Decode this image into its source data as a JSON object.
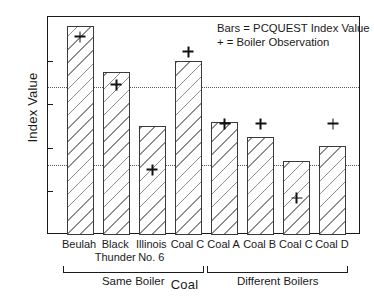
{
  "chart_data": {
    "type": "bar",
    "title": "",
    "xlabel": "Coal",
    "ylabel": "Index Value",
    "ylim": [
      0,
      100
    ],
    "yticks": [
      0,
      20,
      40,
      60,
      80,
      100
    ],
    "ytick_labels": [
      "0",
      "20",
      "40",
      "60",
      "80",
      "100"
    ],
    "grid": false,
    "legend_position": "top-right",
    "legend": [
      "Bars = PCQUEST Index Value",
      "+ = Boiler Observation"
    ],
    "categories": [
      "Beulah",
      "Black Thunder",
      "Illinois No. 6",
      "Coal C",
      "Coal A",
      "Coal B",
      "Coal C",
      "Coal D"
    ],
    "category_lines": [
      [
        "Beulah"
      ],
      [
        "Black",
        "Thunder"
      ],
      [
        "Illinois",
        "No. 6"
      ],
      [
        "Coal C"
      ],
      [
        "Coal A"
      ],
      [
        "Coal B"
      ],
      [
        "Coal C"
      ],
      [
        "Coal D"
      ]
    ],
    "series": [
      {
        "name": "Bars = PCQUEST Index Value",
        "type": "bar",
        "values": [
          96,
          75,
          50,
          80,
          52,
          45,
          34,
          41
        ]
      },
      {
        "name": "+ = Boiler Observation",
        "type": "scatter",
        "marker": "plus",
        "values": [
          91,
          69,
          30,
          84,
          51,
          51,
          17,
          51
        ]
      }
    ],
    "reference_lines": [
      68,
      32
    ],
    "groups": [
      {
        "label": "Same Boiler",
        "from": 0,
        "to": 3
      },
      {
        "label": "Different Boilers",
        "from": 4,
        "to": 7
      }
    ]
  }
}
